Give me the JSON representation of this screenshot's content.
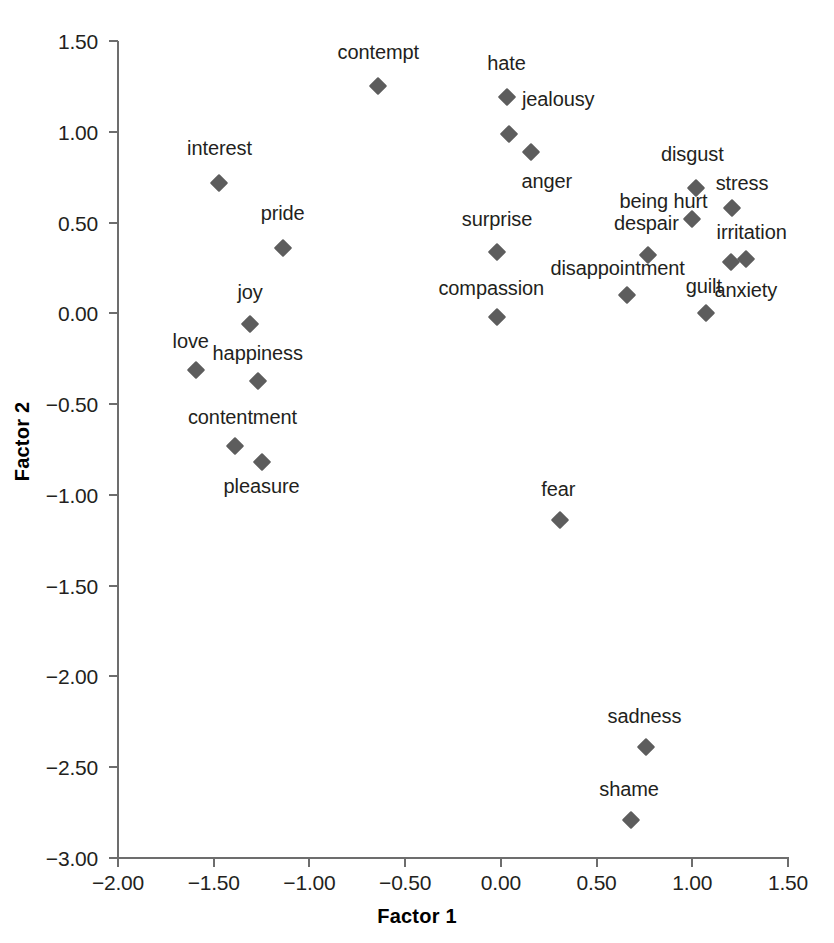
{
  "chart_data": {
    "type": "scatter",
    "title": "",
    "xlabel": "Factor 1",
    "ylabel": "Factor 2",
    "xlim": [
      -2.0,
      1.5
    ],
    "ylim": [
      -3.0,
      1.5
    ],
    "xticks": [
      "-2.00",
      "-1.50",
      "-1.00",
      "-0.50",
      "0.00",
      "0.50",
      "1.00",
      "1.50"
    ],
    "xtick_values": [
      -2.0,
      -1.5,
      -1.0,
      -0.5,
      0.0,
      0.5,
      1.0,
      1.5
    ],
    "yticks": [
      "1.50",
      "1.00",
      "0.50",
      "0.00",
      "-0.50",
      "-1.00",
      "-1.50",
      "-2.00",
      "-2.50",
      "-3.00"
    ],
    "ytick_values": [
      1.5,
      1.0,
      0.5,
      0.0,
      -0.5,
      -1.0,
      -1.5,
      -2.0,
      -2.5,
      -3.0
    ],
    "grid": false,
    "legend": false,
    "marker_shape": "diamond",
    "marker_color": "#5d5d5d",
    "axis_color": "#6d6d6d",
    "points": [
      {
        "label": "contempt",
        "x": -0.64,
        "y": 1.25,
        "lx": -0.64,
        "ly": 1.44,
        "align": "center"
      },
      {
        "label": "hate",
        "x": 0.03,
        "y": 1.19,
        "lx": 0.03,
        "ly": 1.38,
        "align": "center"
      },
      {
        "label": "jealousy",
        "x": 0.04,
        "y": 0.99,
        "lx": 0.11,
        "ly": 1.18,
        "align": "left"
      },
      {
        "label": "anger",
        "x": 0.16,
        "y": 0.89,
        "lx": 0.24,
        "ly": 0.73,
        "align": "center"
      },
      {
        "label": "interest",
        "x": -1.47,
        "y": 0.72,
        "lx": -1.47,
        "ly": 0.91,
        "align": "center"
      },
      {
        "label": "disgust",
        "x": 1.02,
        "y": 0.69,
        "lx": 1.0,
        "ly": 0.88,
        "align": "center"
      },
      {
        "label": "stress",
        "x": 1.21,
        "y": 0.58,
        "lx": 1.26,
        "ly": 0.72,
        "align": "center"
      },
      {
        "label": "being hurt",
        "x": 1.0,
        "y": 0.52,
        "lx": 0.85,
        "ly": 0.62,
        "align": "center"
      },
      {
        "label": "pride",
        "x": -1.14,
        "y": 0.36,
        "lx": -1.14,
        "ly": 0.55,
        "align": "center"
      },
      {
        "label": "surprise",
        "x": -0.02,
        "y": 0.34,
        "lx": -0.02,
        "ly": 0.52,
        "align": "center"
      },
      {
        "label": "despair",
        "x": 0.77,
        "y": 0.32,
        "lx": 0.76,
        "ly": 0.5,
        "align": "center"
      },
      {
        "label": "irritation",
        "x": 1.28,
        "y": 0.3,
        "lx": 1.31,
        "ly": 0.45,
        "align": "center"
      },
      {
        "label": "anxiety",
        "x": 1.2,
        "y": 0.28,
        "lx": 1.28,
        "ly": 0.13,
        "align": "center"
      },
      {
        "label": "disappointment",
        "x": 0.66,
        "y": 0.1,
        "lx": 0.61,
        "ly": 0.25,
        "align": "center"
      },
      {
        "label": "compassion",
        "x": -0.02,
        "y": -0.02,
        "lx": -0.05,
        "ly": 0.14,
        "align": "center"
      },
      {
        "label": "guilt",
        "x": 1.07,
        "y": 0.0,
        "lx": 1.06,
        "ly": 0.15,
        "align": "center"
      },
      {
        "label": "joy",
        "x": -1.31,
        "y": -0.06,
        "lx": -1.31,
        "ly": 0.12,
        "align": "center"
      },
      {
        "label": "love",
        "x": -1.59,
        "y": -0.31,
        "lx": -1.62,
        "ly": -0.15,
        "align": "center"
      },
      {
        "label": "happiness",
        "x": -1.27,
        "y": -0.37,
        "lx": -1.27,
        "ly": -0.22,
        "align": "center"
      },
      {
        "label": "contentment",
        "x": -1.39,
        "y": -0.73,
        "lx": -1.35,
        "ly": -0.57,
        "align": "center"
      },
      {
        "label": "pleasure",
        "x": -1.25,
        "y": -0.82,
        "lx": -1.25,
        "ly": -0.95,
        "align": "center"
      },
      {
        "label": "fear",
        "x": 0.31,
        "y": -1.14,
        "lx": 0.3,
        "ly": -0.97,
        "align": "center"
      },
      {
        "label": "sadness",
        "x": 0.76,
        "y": -2.39,
        "lx": 0.75,
        "ly": -2.22,
        "align": "center"
      },
      {
        "label": "shame",
        "x": 0.68,
        "y": -2.79,
        "lx": 0.67,
        "ly": -2.62,
        "align": "center"
      }
    ]
  },
  "figure": {
    "xlabel": "Factor 1",
    "ylabel": "Factor 2"
  }
}
